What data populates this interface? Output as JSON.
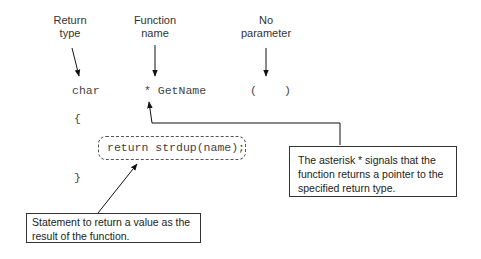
{
  "labels": {
    "return_type": "Return\ntype",
    "function_name": "Function\nname",
    "no_parameter": "No\nparameter"
  },
  "code": {
    "return_type": "char",
    "asterisk_name": "* GetName",
    "open_paren": "(",
    "close_paren": ")",
    "open_brace": "{",
    "statement": "return strdup(name);",
    "close_brace": "}"
  },
  "callouts": {
    "asterisk": "The asterisk * signals that the function returns a pointer to the specified return type.",
    "statement": "Statement to return a value as the result of the function."
  }
}
